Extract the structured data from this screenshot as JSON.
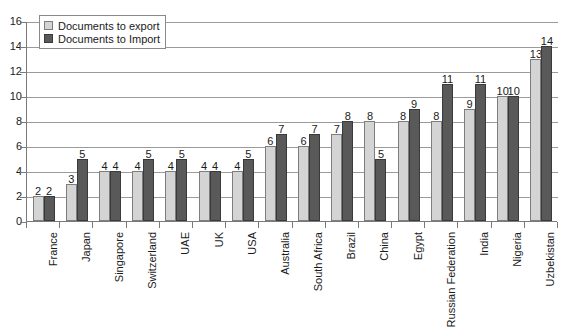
{
  "chart_data": {
    "type": "bar",
    "title": "",
    "subtitle": "",
    "xlabel": "",
    "ylabel": "",
    "ylim": [
      0,
      16
    ],
    "ytick_step": 2,
    "yticks": [
      0,
      2,
      4,
      6,
      8,
      10,
      12,
      14,
      16
    ],
    "grid": true,
    "legend_position": "top-left",
    "categories": [
      "France",
      "Japan",
      "Singapore",
      "Switzerland",
      "UAE",
      "UK",
      "USA",
      "Australia",
      "South Africa",
      "Brazil",
      "China",
      "Egypt",
      "Russian Federation",
      "India",
      "Nigeria",
      "Uzbekistan"
    ],
    "series": [
      {
        "name": "Documents to export",
        "color": "#d4d4d4",
        "values": [
          2,
          3,
          4,
          4,
          4,
          4,
          4,
          6,
          6,
          7,
          8,
          8,
          8,
          9,
          10,
          13
        ]
      },
      {
        "name": "Documents to Import",
        "color": "#595959",
        "values": [
          2,
          5,
          4,
          5,
          5,
          4,
          5,
          7,
          7,
          8,
          5,
          9,
          11,
          11,
          10,
          14
        ]
      }
    ]
  },
  "legend": {
    "items": [
      {
        "label": "Documents to export",
        "swatch": "export"
      },
      {
        "label": "Documents to Import",
        "swatch": "import"
      }
    ]
  },
  "colors": {
    "export_fill": "#d4d4d4",
    "import_fill": "#595959",
    "gridline": "#9b9b9b",
    "axis": "#7a7a7a",
    "text": "#1a1a1a",
    "background": "#ffffff"
  }
}
